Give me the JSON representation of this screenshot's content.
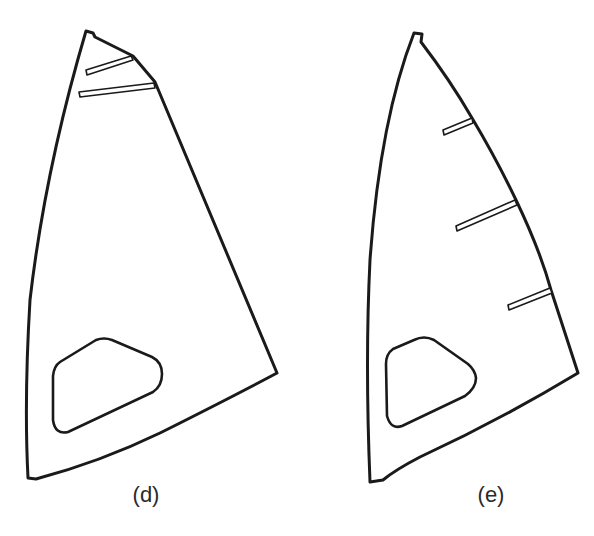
{
  "figure": {
    "panels": [
      {
        "id": "d",
        "label": "(d)",
        "description": "Sail with two short battens near the head and a window near the foot",
        "batten_count": 2,
        "has_window": true
      },
      {
        "id": "e",
        "label": "(e)",
        "description": "Sail with three battens along the leech and a window near the foot",
        "batten_count": 3,
        "has_window": true
      }
    ],
    "colors": {
      "line": "#1a1a1a",
      "background": "#ffffff"
    }
  }
}
